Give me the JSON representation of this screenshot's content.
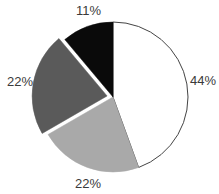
{
  "chart_data": {
    "type": "pie",
    "title": "",
    "start_angle_deg": 0,
    "direction": "clockwise",
    "slices": [
      {
        "label": "44%",
        "value": 44,
        "color": "#ffffff",
        "exploded": false
      },
      {
        "label": "22%",
        "value": 22,
        "color": "#a9a9a9",
        "exploded": false
      },
      {
        "label": "22%",
        "value": 22,
        "color": "#5a5a5a",
        "exploded": true
      },
      {
        "label": "11%",
        "value": 11,
        "color": "#0a0a0a",
        "exploded": false
      }
    ],
    "stroke_color": "#444444",
    "legend": null
  },
  "labels": {
    "white": "44%",
    "light_gray": "22%",
    "dark_gray": "22%",
    "black": "11%"
  }
}
